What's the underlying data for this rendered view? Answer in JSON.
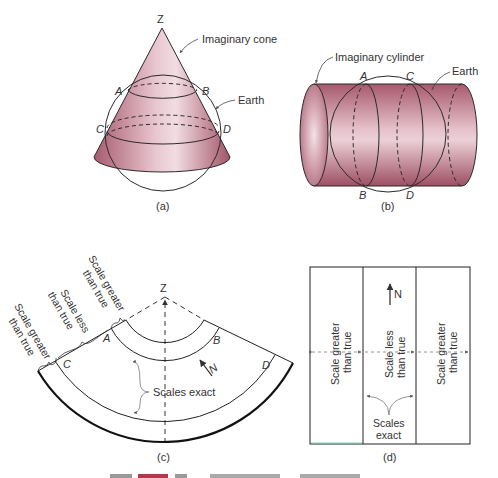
{
  "figure": {
    "panels": {
      "a": {
        "caption": "(a)",
        "apex_label": "Z",
        "points": [
          "A",
          "B",
          "C",
          "D"
        ],
        "callouts": {
          "cone": "Imaginary cone",
          "earth": "Earth"
        },
        "colors": {
          "fill": "#b0667a",
          "highlight": "#f3dde3",
          "stroke": "#2a2a2a"
        }
      },
      "b": {
        "caption": "(b)",
        "points": [
          "A",
          "C",
          "B",
          "D"
        ],
        "callouts": {
          "cylinder": "Imaginary cylinder",
          "earth": "Earth"
        },
        "colors": {
          "fill": "#b0667a",
          "highlight": "#f3dde3",
          "stroke": "#2a2a2a"
        }
      },
      "c": {
        "caption": "(c)",
        "apex_label": "Z",
        "points": [
          "A",
          "B",
          "C",
          "D"
        ],
        "north_label": "N",
        "scales_label": "Scales exact",
        "zone_labels": [
          {
            "line1": "Scale greater",
            "line2": "than true"
          },
          {
            "line1": "Scale less",
            "line2": "than true"
          },
          {
            "line1": "Scale greater",
            "line2": "than true"
          }
        ]
      },
      "d": {
        "caption": "(d)",
        "north_label": "N",
        "columns": [
          {
            "line1": "Scale greater",
            "line2": "than true"
          },
          {
            "line1": "Scale less",
            "line2": "than true"
          },
          {
            "line1": "Scale greater",
            "line2": "than true"
          }
        ],
        "scales_label_line1": "Scales",
        "scales_label_line2": "exact"
      }
    }
  }
}
